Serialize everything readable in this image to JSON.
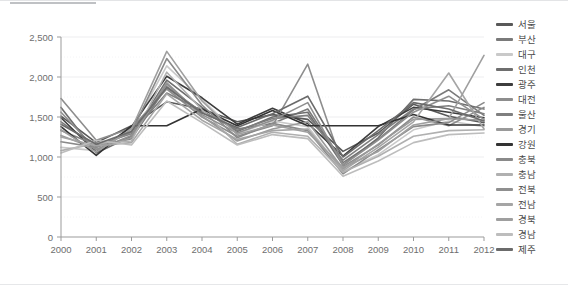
{
  "chart_data": {
    "type": "line",
    "title": "",
    "xlabel": "",
    "ylabel": "",
    "x": [
      2000,
      2001,
      2002,
      2003,
      2004,
      2005,
      2006,
      2007,
      2008,
      2009,
      2010,
      2011,
      2012
    ],
    "categories": [
      "2000",
      "2001",
      "2002",
      "2003",
      "2004",
      "2005",
      "2006",
      "2007",
      "2008",
      "2009",
      "2010",
      "2011",
      "2012"
    ],
    "ylim": [
      0,
      2500
    ],
    "yticks": [
      0,
      500,
      1000,
      1500,
      2000,
      2500
    ],
    "ytick_labels": [
      "0",
      "500",
      "1,000",
      "1,500",
      "2,000",
      "2,500"
    ],
    "grid": true,
    "legend_position": "right",
    "series": [
      {
        "name": "서울",
        "color": "#595959",
        "values": [
          1510,
          1180,
          1390,
          1690,
          1600,
          1440,
          1530,
          1470,
          1070,
          1300,
          1660,
          1510,
          1430
        ]
      },
      {
        "name": "부산",
        "color": "#7a7a7a",
        "values": [
          1440,
          1130,
          1230,
          1880,
          1560,
          1350,
          1420,
          1600,
          930,
          1220,
          1590,
          1840,
          1520
        ]
      },
      {
        "name": "대구",
        "color": "#c9c9c9",
        "values": [
          1120,
          1080,
          1330,
          2140,
          1720,
          1290,
          1450,
          1380,
          820,
          1030,
          1340,
          1450,
          1380
        ]
      },
      {
        "name": "인천",
        "color": "#6e6e6e",
        "values": [
          1620,
          1050,
          1260,
          1960,
          1620,
          1320,
          1500,
          1560,
          900,
          1240,
          1720,
          1700,
          1600
        ]
      },
      {
        "name": "광주",
        "color": "#3d3d3d",
        "values": [
          1490,
          1060,
          1380,
          2010,
          1740,
          1410,
          1610,
          1420,
          1010,
          1380,
          1620,
          1560,
          1490
        ]
      },
      {
        "name": "대전",
        "color": "#8d8d8d",
        "values": [
          1730,
          1210,
          1360,
          1850,
          1500,
          1260,
          1390,
          2160,
          880,
          1150,
          1500,
          1390,
          1620
        ]
      },
      {
        "name": "울산",
        "color": "#7f7f7f",
        "values": [
          1330,
          1150,
          1290,
          1800,
          1580,
          1330,
          1480,
          1520,
          960,
          1280,
          1600,
          1640,
          1540
        ]
      },
      {
        "name": "경기",
        "color": "#9a9a9a",
        "values": [
          1270,
          1100,
          1240,
          1930,
          1510,
          1200,
          1350,
          1440,
          850,
          1160,
          1470,
          1480,
          1460
        ]
      },
      {
        "name": "강원",
        "color": "#333333",
        "values": [
          1380,
          1020,
          1390,
          1390,
          1600,
          1390,
          1580,
          1390,
          1390,
          1390,
          1530,
          1400,
          1400
        ]
      },
      {
        "name": "충북",
        "color": "#8a8a8a",
        "values": [
          1190,
          1120,
          1310,
          2230,
          1650,
          1240,
          1420,
          1330,
          790,
          1090,
          1380,
          1430,
          1680
        ]
      },
      {
        "name": "충남",
        "color": "#b0b0b0",
        "values": [
          1080,
          1170,
          1200,
          2060,
          1590,
          1160,
          1310,
          1260,
          810,
          1010,
          1260,
          1330,
          1340
        ]
      },
      {
        "name": "전북",
        "color": "#8f8f8f",
        "values": [
          1560,
          1090,
          1270,
          1910,
          1530,
          1300,
          1460,
          1680,
          900,
          1210,
          1560,
          1760,
          1470
        ]
      },
      {
        "name": "전남",
        "color": "#a5a5a5",
        "values": [
          1250,
          1140,
          1180,
          1790,
          1460,
          1220,
          1330,
          1350,
          830,
          1120,
          1440,
          2050,
          1350
        ]
      },
      {
        "name": "경북",
        "color": "#9f9f9f",
        "values": [
          1340,
          1060,
          1350,
          2320,
          1700,
          1280,
          1400,
          1310,
          870,
          1070,
          1400,
          1480,
          2270
        ]
      },
      {
        "name": "경남",
        "color": "#bdbdbd",
        "values": [
          1050,
          1210,
          1150,
          1700,
          1430,
          1150,
          1280,
          1230,
          760,
          950,
          1180,
          1280,
          1300
        ]
      },
      {
        "name": "제주",
        "color": "#6b6b6b",
        "values": [
          1410,
          1160,
          1320,
          1870,
          1550,
          1370,
          1540,
          1760,
          1000,
          1330,
          1680,
          1600,
          1450
        ]
      }
    ]
  },
  "axes": {
    "x_tick_labels": [
      "2000",
      "2001",
      "2002",
      "2003",
      "2004",
      "2005",
      "2006",
      "2007",
      "2008",
      "2009",
      "2010",
      "2011",
      "2012"
    ],
    "y_tick_labels": [
      "2,500",
      "2,000",
      "1,500",
      "1,000",
      "500",
      "0"
    ]
  },
  "legend": {
    "items": [
      {
        "label": "서울"
      },
      {
        "label": "부산"
      },
      {
        "label": "대구"
      },
      {
        "label": "인천"
      },
      {
        "label": "광주"
      },
      {
        "label": "대전"
      },
      {
        "label": "울산"
      },
      {
        "label": "경기"
      },
      {
        "label": "강원"
      },
      {
        "label": "충북"
      },
      {
        "label": "충남"
      },
      {
        "label": "전북"
      },
      {
        "label": "전남"
      },
      {
        "label": "경북"
      },
      {
        "label": "경남"
      },
      {
        "label": "제주"
      }
    ]
  }
}
